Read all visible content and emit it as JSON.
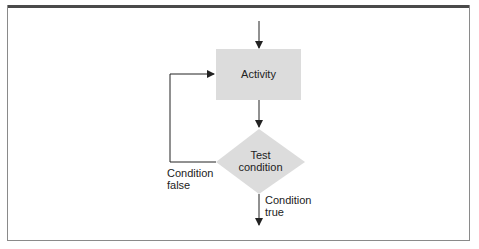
{
  "diagram": {
    "nodes": [
      {
        "id": "activity",
        "shape": "rectangle",
        "label": "Activity"
      },
      {
        "id": "test",
        "shape": "diamond",
        "label_line1": "Test",
        "label_line2": "condition"
      }
    ],
    "edges": [
      {
        "from": "entry",
        "to": "activity"
      },
      {
        "from": "activity",
        "to": "test"
      },
      {
        "from": "test",
        "to": "activity",
        "label_line1": "Condition",
        "label_line2": "false"
      },
      {
        "from": "test",
        "to": "exit",
        "label_line1": "Condition",
        "label_line2": "true"
      }
    ],
    "colors": {
      "node_fill": "#dcdcdc",
      "line": "#222222",
      "frame_top": "#4a4a4a"
    }
  }
}
